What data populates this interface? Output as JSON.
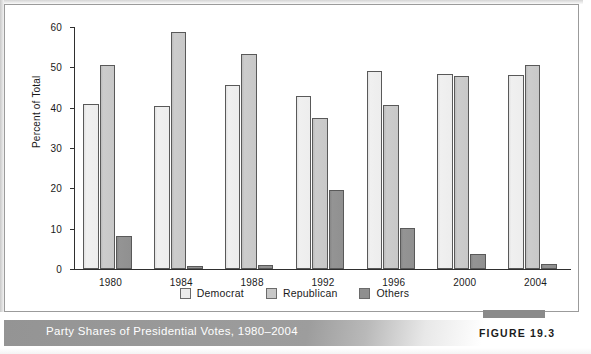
{
  "figure": {
    "caption": "Party Shares of Presidential Votes, 1980–2004",
    "figure_number": "FIGURE 19.3"
  },
  "chart_data": {
    "type": "bar",
    "title": "Party Shares of Presidential Votes, 1980–2004",
    "xlabel": "",
    "ylabel": "Percent of Total",
    "ylim": [
      0,
      60
    ],
    "yticks": [
      0,
      10,
      20,
      30,
      40,
      50,
      60
    ],
    "ytick_labels": [
      "0",
      "10",
      "20",
      "30",
      "40",
      "50",
      "60"
    ],
    "grid": false,
    "legend_position": "bottom-center",
    "categories": [
      "1980",
      "1984",
      "1988",
      "1992",
      "1996",
      "2000",
      "2004"
    ],
    "series": [
      {
        "name": "Democrat",
        "color": "#ececec",
        "values": [
          40.8,
          40.5,
          45.6,
          43.0,
          49.2,
          48.4,
          48.1
        ]
      },
      {
        "name": "Republican",
        "color": "#c7c7c7",
        "values": [
          50.7,
          58.8,
          53.3,
          37.4,
          40.7,
          47.9,
          50.6
        ]
      },
      {
        "name": "Others",
        "color": "#8f8f8f",
        "values": [
          8.2,
          0.7,
          1.1,
          19.7,
          10.1,
          3.7,
          1.3
        ]
      }
    ]
  }
}
